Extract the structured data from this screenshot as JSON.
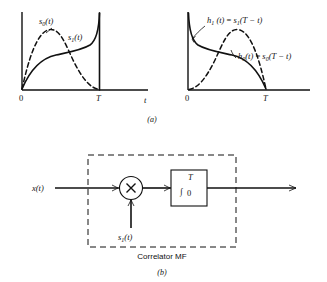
{
  "figure": {
    "panel_a": {
      "caption": "(a)",
      "left_plot": {
        "axis_x_label": "t",
        "origin_label": "0",
        "tick_T_label": "T",
        "curve_dashed_label": {
          "base": "s",
          "sub": "0",
          "arg": "(t)"
        },
        "curve_solid_label": {
          "base": "s",
          "sub": "1",
          "arg": "(t)"
        }
      },
      "right_plot": {
        "origin_label": "0",
        "tick_T_label": "T",
        "curve_solid_label": {
          "base": "h",
          "sub": "1",
          "arg": "(t)",
          "equals": "=",
          "rhs_base": "s",
          "rhs_sub": "1",
          "rhs_arg": "(T − t)"
        },
        "curve_dashed_label": {
          "base": "h",
          "sub": "0",
          "arg": "(t)",
          "equals": "=",
          "rhs_base": "s",
          "rhs_sub": "0",
          "rhs_arg": "(T − t)"
        }
      }
    },
    "panel_b": {
      "caption": "(b)",
      "block_label": "Correlator MF",
      "input_label": {
        "base": "x",
        "arg": "(t)"
      },
      "reference_label": {
        "base": "s",
        "sub": "1",
        "arg": "(t)"
      },
      "multiplier_glyph": "×",
      "integrator": {
        "glyph": "∫",
        "upper_limit": "T",
        "lower_limit": "0"
      }
    }
  },
  "colors": {
    "ink": "#111111",
    "paper": "#ffffff"
  }
}
